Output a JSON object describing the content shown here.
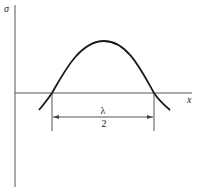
{
  "diagram": {
    "y_axis_label": "σ",
    "x_axis_label": "x",
    "dimension": {
      "numerator": "λ",
      "denominator": "2"
    },
    "colors": {
      "axes": "#555555",
      "curve": "#1a1a1a",
      "dimension": "#444444"
    }
  }
}
